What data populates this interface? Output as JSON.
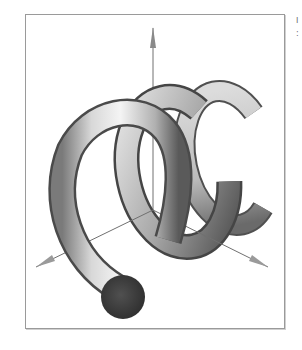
{
  "figure": {
    "render_style": "grayscale flat-shaded polygons",
    "coils": 3,
    "axes": [
      {
        "name": "z-axis",
        "direction": "up"
      },
      {
        "name": "x-axis",
        "direction": "lower-left"
      },
      {
        "name": "y-axis",
        "direction": "lower-right"
      }
    ],
    "colors": {
      "frame_border": "#9a9a9a",
      "tube_light": "#f2f2f2",
      "tube_mid": "#b8b8b8",
      "tube_dark": "#4a4a4a",
      "end_cap": "#3c3c3c",
      "axis_line": "#707070"
    }
  },
  "edge_fragments": [
    "I",
    ":"
  ]
}
